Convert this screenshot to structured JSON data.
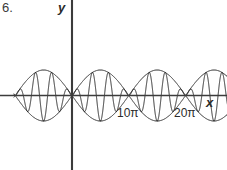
{
  "figure": {
    "problem_number": "6.",
    "axis_labels": {
      "x": "x",
      "y": "y"
    },
    "tick_labels": [
      {
        "name": "10pi",
        "text": "10π"
      },
      {
        "name": "20pi",
        "text": "20π"
      }
    ],
    "colors": {
      "curve": "#1a1a1a",
      "axis": "#3c3c3c",
      "background": "#ffffff",
      "text": "#2b2b2b"
    }
  },
  "chart_data": {
    "type": "line",
    "title": "",
    "xlabel": "x",
    "ylabel": "y",
    "grid": false,
    "legend": false,
    "function": "y = A * sin(x/10) * sin(x)",
    "amplitude": 1,
    "envelope_period_x": "10π",
    "carrier_cycles_per_lobe": 7,
    "xlim": [
      -10.2,
      29.8
    ],
    "ylim": [
      -1.35,
      1.35
    ],
    "x_tick_values": [
      10,
      20
    ],
    "x_tick_labels": [
      "10π",
      "20π"
    ],
    "y_tick_values": [],
    "y_tick_labels": [],
    "nodes_x": [
      -10,
      0,
      10,
      20,
      30
    ],
    "lobes": [
      {
        "index": 1,
        "x_start": -10,
        "x_end": 0,
        "sign": "positive-start"
      },
      {
        "index": 2,
        "x_start": 0,
        "x_end": 10,
        "sign": "positive-start"
      },
      {
        "index": 3,
        "x_start": 10,
        "x_end": 20,
        "sign": "positive-start"
      },
      {
        "index": 4,
        "x_start": 20,
        "x_end": 30,
        "sign": "positive-start",
        "clipped": true
      }
    ],
    "axes": {
      "x_axis_y": 0,
      "y_axis_x": 0,
      "x_axis_visible": true,
      "y_axis_visible": true
    }
  }
}
